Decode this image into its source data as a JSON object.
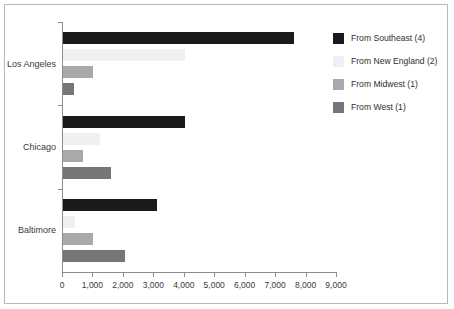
{
  "chart_data": {
    "type": "bar",
    "orientation": "horizontal",
    "title": "",
    "xlabel": "",
    "ylabel": "",
    "categories": [
      "Los Angeles",
      "Chicago",
      "Baltimore"
    ],
    "series": [
      {
        "name": "From Southeast (4)",
        "color": "#1a1a1a",
        "values": [
          7600,
          4000,
          3100
        ]
      },
      {
        "name": "From New England (2)",
        "color": "#f0f0f0",
        "values": [
          4000,
          1200,
          380
        ]
      },
      {
        "name": "From Midwest (1)",
        "color": "#a9a9a9",
        "values": [
          1000,
          650,
          1000
        ]
      },
      {
        "name": "From West (1)",
        "color": "#767676",
        "values": [
          350,
          1570,
          2030
        ]
      }
    ],
    "xlim": [
      0,
      9000
    ],
    "xticks": [
      0,
      1000,
      2000,
      3000,
      4000,
      5000,
      6000,
      7000,
      8000,
      9000
    ],
    "xtick_labels": [
      "0",
      "1,000",
      "2,000",
      "3,000",
      "4,000",
      "5,000",
      "6,000",
      "7,000",
      "8,000",
      "9,000"
    ],
    "grid": false,
    "legend_position": "right"
  },
  "legend": {
    "items": [
      {
        "label": "From Southeast (4)",
        "color": "#1a1a1a"
      },
      {
        "label": "From New England (2)",
        "color": "#f0f0f0"
      },
      {
        "label": "From Midwest (1)",
        "color": "#a9a9a9"
      },
      {
        "label": "From West (1)",
        "color": "#767676"
      }
    ]
  },
  "colors": {
    "frame": "#b9b9bc",
    "axis": "#8d8d91",
    "text": "#3a3a3c",
    "background": "#ffffff"
  }
}
